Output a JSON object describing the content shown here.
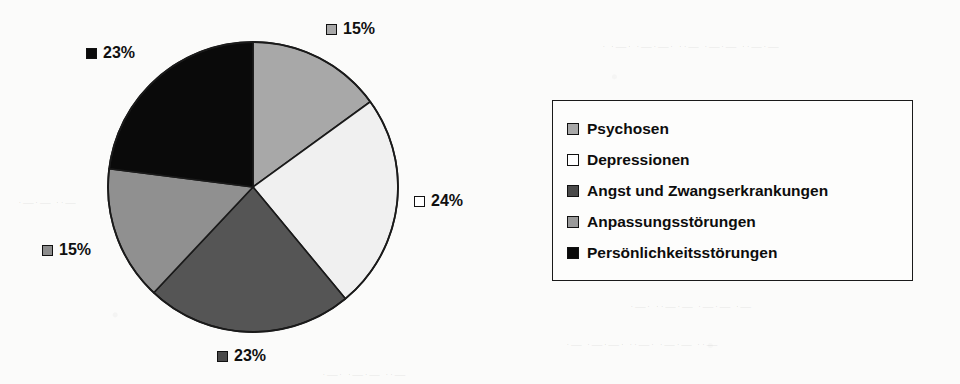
{
  "chart_data": {
    "type": "pie",
    "title": "",
    "categories": [
      "Psychosen",
      "Depressionen",
      "Angst und Zwangserkrankungen",
      "Anpassungsstörungen",
      "Persönlichkeitsstörungen"
    ],
    "values": [
      15,
      24,
      23,
      15,
      23
    ],
    "value_labels": [
      "15%",
      "24%",
      "23%",
      "15%",
      "23%"
    ],
    "unit": "%",
    "colors": [
      "#a8a8a8",
      "#f0f0f0",
      "#555555",
      "#909090",
      "#0a0a0a"
    ],
    "start_angle_deg": 0,
    "direction": "clockwise",
    "grid": false,
    "legend_position": "right",
    "xlabel": "",
    "ylabel": ""
  },
  "pie": {
    "center_x": 253,
    "center_y": 187,
    "radius": 145,
    "slices": [
      {
        "name": "Psychosen",
        "label": "15%",
        "value": 15,
        "color": "#a8a8a8",
        "swatch": "#a8a8a8"
      },
      {
        "name": "Depressionen",
        "label": "24%",
        "value": 24,
        "color": "#f0f0f0",
        "swatch": "#ffffff"
      },
      {
        "name": "Angst und Zwangserkrankungen",
        "label": "23%",
        "value": 23,
        "color": "#555555",
        "swatch": "#4a4a4a"
      },
      {
        "name": "Anpassungsstörungen",
        "label": "15%",
        "value": 15,
        "color": "#909090",
        "swatch": "#8d8d8d"
      },
      {
        "name": "Persönlichkeitsstörungen",
        "label": "23%",
        "value": 23,
        "color": "#0a0a0a",
        "swatch": "#0a0a0a"
      }
    ]
  },
  "labels": [
    {
      "text": "15%",
      "swatch": "#a8a8a8",
      "x": 326,
      "y": 20
    },
    {
      "text": "24%",
      "swatch": "#ffffff",
      "x": 414,
      "y": 192
    },
    {
      "text": "23%",
      "swatch": "#4a4a4a",
      "x": 217,
      "y": 347
    },
    {
      "text": "15%",
      "swatch": "#8d8d8d",
      "x": 42,
      "y": 241
    },
    {
      "text": "23%",
      "swatch": "#0a0a0a",
      "x": 86,
      "y": 44
    }
  ],
  "legend": {
    "items": [
      {
        "label": "Psychosen",
        "swatch": "#a8a8a8"
      },
      {
        "label": "Depressionen",
        "swatch": "#ffffff"
      },
      {
        "label": "Angst und Zwangserkrankungen",
        "swatch": "#4a4a4a"
      },
      {
        "label": "Anpassungsstörungen",
        "swatch": "#9a9a9a"
      },
      {
        "label": "Persönlichkeitsstörungen",
        "swatch": "#0a0a0a"
      }
    ]
  },
  "background": {
    "ghost_lines": [
      {
        "text": "·  ·—· ·—·—· ··—  ·—·—  ··—·—",
        "x": 602,
        "y": 40,
        "size": 11
      },
      {
        "text": "—·—  ··—·  ·—··—  ·—·—·  ··",
        "x": 640,
        "y": 132,
        "size": 11
      },
      {
        "text": "··—  ·—·—  ·—··  ·—·—·—",
        "x": 700,
        "y": 178,
        "size": 11
      },
      {
        "text": "·—·  ··—·—  ·—·—  ·—",
        "x": 630,
        "y": 300,
        "size": 11
      },
      {
        "text": "·—  ·—·—·  ··—·  ·—·—  ··—",
        "x": 566,
        "y": 338,
        "size": 11
      },
      {
        "text": "·—·  ·—·—  ··—",
        "x": 322,
        "y": 368,
        "size": 11
      },
      {
        "text": "·—·—  ··—",
        "x": 18,
        "y": 196,
        "size": 11
      }
    ]
  }
}
